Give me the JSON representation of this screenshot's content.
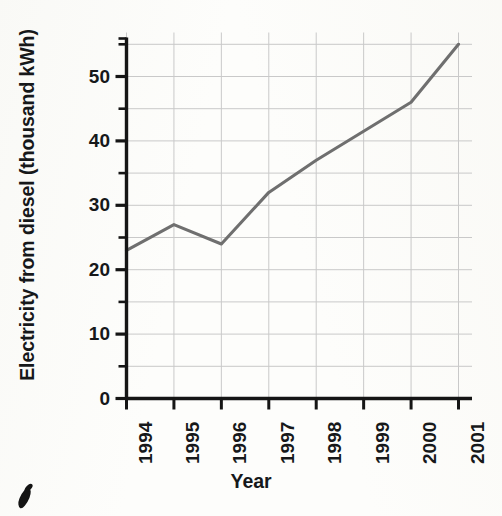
{
  "chart_data": {
    "type": "line",
    "title": "",
    "xlabel": "Year",
    "ylabel": "Electricity from diesel (thousand kWh)",
    "categories": [
      "1994",
      "1995",
      "1996",
      "1997",
      "1998",
      "1999",
      "2000",
      "2001"
    ],
    "x": [
      1994,
      1995,
      1996,
      1997,
      1998,
      1999,
      2000,
      2001
    ],
    "values": [
      23,
      27,
      24,
      32,
      37,
      41.5,
      46,
      55
    ],
    "series": [
      {
        "name": "Electricity from diesel",
        "values": [
          23,
          27,
          24,
          32,
          37,
          41.5,
          46,
          55
        ]
      }
    ],
    "ylim": [
      0,
      57
    ],
    "xlim": [
      "1994",
      "2001"
    ],
    "y_major_ticks": [
      0,
      10,
      20,
      30,
      40,
      50
    ],
    "y_minor_ticks": [
      5,
      15,
      25,
      35,
      45,
      55
    ],
    "y_tick_labels": [
      "0",
      "10",
      "20",
      "30",
      "40",
      "50"
    ],
    "x_tick_labels": [
      "1994",
      "1995",
      "1996",
      "1997",
      "1998",
      "1999",
      "2000",
      "2001"
    ],
    "grid": "horizontal-and-vertical",
    "grid_color": "#c9c9c9",
    "line_color": "#6f6f6f",
    "axis_color": "#151515",
    "legend": "none",
    "legend_position": "none"
  },
  "figure": {
    "background_color": "#fdfdfb",
    "artifact": "ink-stroke-mark"
  }
}
